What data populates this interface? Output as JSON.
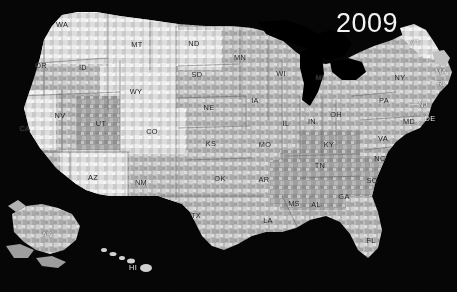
{
  "figure": {
    "type": "choropleth-map",
    "region": "United States",
    "resolution": "county",
    "color_scheme": "grayscale",
    "background_color": "#050505",
    "water_color": "#000000",
    "year_label": "2009",
    "year_color": "#f2f2f2"
  },
  "chart_data": {
    "type": "heatmap",
    "title": "2009",
    "xlabel": "",
    "ylabel": "",
    "legend_position": "none",
    "grid": false,
    "palette": [
      "#f4f4f4",
      "#e2e2e2",
      "#cfcfcf",
      "#bcbcbc",
      "#a8a8a8",
      "#959595",
      "#848484"
    ],
    "categories": [
      "WA",
      "OR",
      "ID",
      "MT",
      "WY",
      "NV",
      "UT",
      "CO",
      "CA",
      "AZ",
      "NM",
      "ND",
      "SD",
      "NE",
      "KS",
      "OK",
      "TX",
      "MN",
      "IA",
      "MO",
      "AR",
      "LA",
      "WI",
      "IL",
      "MI",
      "IN",
      "OH",
      "KY",
      "TN",
      "MS",
      "AL",
      "GA",
      "FL",
      "SC",
      "NC",
      "VA",
      "WV",
      "MD",
      "DE",
      "NJ",
      "PA",
      "NY",
      "CT",
      "RI",
      "MA",
      "VT",
      "NH",
      "ME",
      "AK",
      "HI"
    ],
    "values": [
      2,
      3,
      3,
      2,
      1,
      4,
      2,
      1,
      3,
      2,
      3,
      3,
      4,
      3,
      4,
      4,
      4,
      3,
      4,
      4,
      5,
      5,
      4,
      4,
      4,
      4,
      4,
      5,
      5,
      6,
      5,
      5,
      3,
      5,
      5,
      4,
      5,
      4,
      4,
      4,
      4,
      3,
      3,
      3,
      3,
      2,
      2,
      2,
      3,
      4
    ]
  },
  "labels": {
    "states": [
      {
        "abbr": "WA",
        "x": 62,
        "y": 25
      },
      {
        "abbr": "OR",
        "x": 41,
        "y": 66
      },
      {
        "abbr": "ID",
        "x": 83,
        "y": 68
      },
      {
        "abbr": "MT",
        "x": 137,
        "y": 45
      },
      {
        "abbr": "WY",
        "x": 136,
        "y": 92
      },
      {
        "abbr": "NV",
        "x": 60,
        "y": 116
      },
      {
        "abbr": "UT",
        "x": 101,
        "y": 124
      },
      {
        "abbr": "CO",
        "x": 152,
        "y": 132
      },
      {
        "abbr": "CA",
        "x": 25,
        "y": 129
      },
      {
        "abbr": "AZ",
        "x": 93,
        "y": 178
      },
      {
        "abbr": "NM",
        "x": 141,
        "y": 183
      },
      {
        "abbr": "ND",
        "x": 194,
        "y": 44
      },
      {
        "abbr": "SD",
        "x": 197,
        "y": 75
      },
      {
        "abbr": "NE",
        "x": 209,
        "y": 108
      },
      {
        "abbr": "KS",
        "x": 211,
        "y": 144
      },
      {
        "abbr": "OK",
        "x": 220,
        "y": 179
      },
      {
        "abbr": "TX",
        "x": 196,
        "y": 216
      },
      {
        "abbr": "MN",
        "x": 240,
        "y": 58
      },
      {
        "abbr": "IA",
        "x": 255,
        "y": 101
      },
      {
        "abbr": "MO",
        "x": 265,
        "y": 145
      },
      {
        "abbr": "AR",
        "x": 264,
        "y": 180
      },
      {
        "abbr": "LA",
        "x": 268,
        "y": 221
      },
      {
        "abbr": "WI",
        "x": 281,
        "y": 74
      },
      {
        "abbr": "IL",
        "x": 286,
        "y": 124
      },
      {
        "abbr": "MI",
        "x": 320,
        "y": 78
      },
      {
        "abbr": "IN",
        "x": 312,
        "y": 122
      },
      {
        "abbr": "OH",
        "x": 336,
        "y": 115
      },
      {
        "abbr": "KY",
        "x": 329,
        "y": 145
      },
      {
        "abbr": "TN",
        "x": 320,
        "y": 166
      },
      {
        "abbr": "MS",
        "x": 294,
        "y": 204
      },
      {
        "abbr": "AL",
        "x": 316,
        "y": 205
      },
      {
        "abbr": "GA",
        "x": 344,
        "y": 197
      },
      {
        "abbr": "FL",
        "x": 371,
        "y": 241
      },
      {
        "abbr": "SC",
        "x": 372,
        "y": 181
      },
      {
        "abbr": "NC",
        "x": 380,
        "y": 159
      },
      {
        "abbr": "VA",
        "x": 383,
        "y": 139
      },
      {
        "abbr": "PA",
        "x": 384,
        "y": 101
      },
      {
        "abbr": "NY",
        "x": 400,
        "y": 78
      },
      {
        "abbr": "VT",
        "x": 415,
        "y": 43
      },
      {
        "abbr": "MA",
        "x": 441,
        "y": 72
      },
      {
        "abbr": "RI",
        "x": 441,
        "y": 84
      },
      {
        "abbr": "NJ",
        "x": 423,
        "y": 105
      },
      {
        "abbr": "DE",
        "x": 430,
        "y": 119
      },
      {
        "abbr": "MD",
        "x": 409,
        "y": 122
      },
      {
        "abbr": "AK",
        "x": 47,
        "y": 235
      },
      {
        "abbr": "HI",
        "x": 133,
        "y": 268
      }
    ],
    "leaders": [
      {
        "x": 424,
        "y": 41,
        "len": 12,
        "angle": 22
      },
      {
        "x": 437,
        "y": 66,
        "len": 9,
        "angle": -150
      },
      {
        "x": 437,
        "y": 82,
        "len": 9,
        "angle": -160
      },
      {
        "x": 419,
        "y": 104,
        "len": 10,
        "angle": 178
      },
      {
        "x": 427,
        "y": 117,
        "len": 10,
        "angle": 170
      },
      {
        "x": 414,
        "y": 121,
        "len": 8,
        "angle": -10
      }
    ]
  }
}
